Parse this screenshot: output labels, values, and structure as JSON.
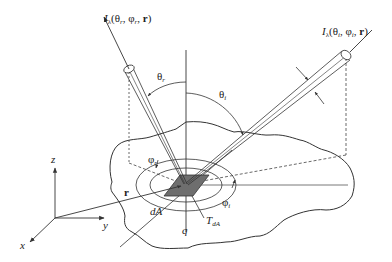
{
  "diagram": {
    "type": "radiation-geometry",
    "colors": {
      "line": "#333333",
      "patch_fill": "#6e6e6e",
      "background": "#ffffff"
    },
    "labels": {
      "reflected_intensity": "Iλ(θr, φr, r)",
      "reflected_intensity_parts": {
        "I": "I",
        "sub": "λ",
        "args": "(θ",
        "s1": "r",
        "mid": ", φ",
        "s2": "r",
        "end": ", ",
        "r": "r",
        "close": ")"
      },
      "incident_intensity": "Iλ(θi, φi, r)",
      "incident_intensity_parts": {
        "I": "I",
        "sub": "λ",
        "args": "(θ",
        "s1": "i",
        "mid": ", φ",
        "s2": "i",
        "end": ", ",
        "r": "r",
        "close": ")"
      },
      "theta_r": {
        "base": "θ",
        "sub": "r"
      },
      "theta_i": {
        "base": "θ",
        "sub": "i"
      },
      "phi_r": {
        "base": "φ",
        "sub": "r"
      },
      "phi_i": {
        "base": "φ",
        "sub": "i"
      },
      "T_dA": {
        "base": "T",
        "sub": "dA"
      },
      "dA": "dA",
      "q": "q",
      "r_vec": "r",
      "axis_x": "x",
      "axis_y": "y",
      "axis_z": "z"
    }
  }
}
